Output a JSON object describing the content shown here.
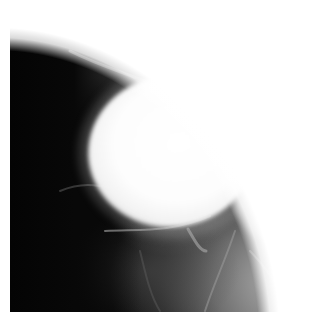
{
  "image": {
    "type": "radiograph",
    "description": "Grayscale X-ray (mammographic view) showing a large bright oval dense mass in the upper-center, dark fatty tissue on the left, and fibroglandular tissue strands along the top curve and lower right",
    "colors": {
      "background": "#ffffff",
      "dark_fat": "#050505",
      "tissue_gray": "#6e6e6e",
      "mass_white": "#ffffff"
    },
    "features": [
      {
        "name": "dense-mass",
        "shape": "oval",
        "approx_center": [
          170,
          150
        ],
        "approx_size": [
          158,
          147
        ]
      },
      {
        "name": "fibroglandular-band",
        "location": "top and upper-right curved margin"
      },
      {
        "name": "fatty-region",
        "location": "left third"
      },
      {
        "name": "parenchyma",
        "location": "lower right"
      }
    ]
  }
}
